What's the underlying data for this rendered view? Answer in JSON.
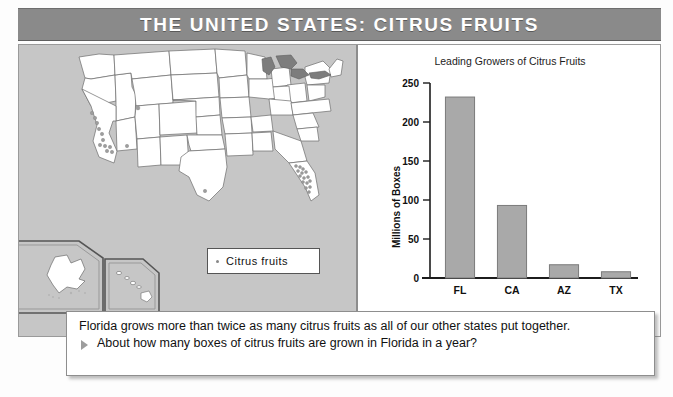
{
  "header": {
    "title": "THE UNITED STATES: CITRUS FRUITS"
  },
  "map": {
    "name": "united-states-citrus-map",
    "legend": {
      "marker": "dot-marker",
      "label": "Citrus fruits"
    },
    "insets": [
      "Alaska",
      "Hawaii"
    ],
    "background_color": "#c6c6c6",
    "state_fill": "#ffffff",
    "lakes_color": "#7d7d7d",
    "dot_color": "#9a9a9a",
    "citrus_states": [
      "California",
      "Arizona",
      "Texas",
      "Florida"
    ]
  },
  "chart_data": {
    "type": "bar",
    "title": "Leading Growers of Citrus Fruits",
    "xlabel": "",
    "ylabel": "Millions of Boxes",
    "categories": [
      "FL",
      "CA",
      "AZ",
      "TX"
    ],
    "values": [
      232,
      93,
      17,
      8
    ],
    "ylim": [
      0,
      250
    ],
    "yticks": [
      0,
      50,
      100,
      150,
      200,
      250
    ],
    "ytick_labels": [
      "0",
      "50",
      "100",
      "150",
      "200",
      "250"
    ],
    "grid": false,
    "legend": "none",
    "bar_color": "#a9a9a9",
    "bar_border_color": "#7b7b7b"
  },
  "caption": {
    "statement": "Florida grows more than twice as many citrus fruits as all of our other states put together.",
    "bullet_icon": "triangle-right-icon",
    "question": "About how many boxes of citrus fruits are grown in Florida in a year?"
  }
}
